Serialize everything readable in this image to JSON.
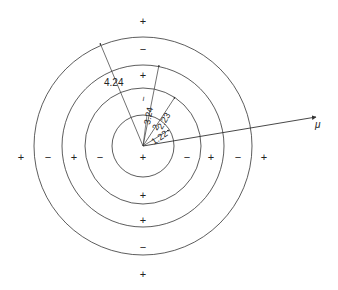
{
  "diagram": {
    "center": {
      "x": 143,
      "y": 146
    },
    "rings": [
      {
        "radius": 31,
        "label": "1.22"
      },
      {
        "radius": 58,
        "label": "2.23"
      },
      {
        "radius": 81,
        "label": "3.24"
      },
      {
        "radius": 108,
        "label": "4.24"
      }
    ],
    "inner_label": "2",
    "minus_label": "−",
    "vector_label": "μ",
    "signs": {
      "horizontal": [
        "+",
        "−",
        "+",
        "−",
        "+",
        "−",
        "+",
        "−",
        "+"
      ],
      "vertical": [
        "+",
        "−",
        "+",
        "−",
        "+",
        "−",
        "+",
        "−",
        "+"
      ]
    },
    "colors": {
      "line": "#333333",
      "text": "#222222"
    }
  }
}
